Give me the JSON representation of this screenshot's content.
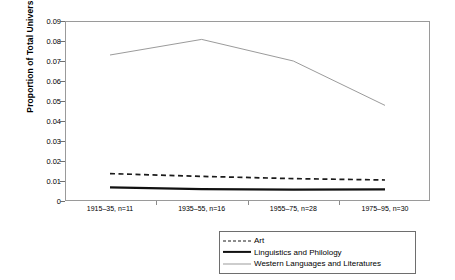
{
  "chart_data": {
    "type": "line",
    "title": "",
    "xlabel": "",
    "ylabel": "Proportion of Total University Faculty",
    "categories": [
      "1915–35, n=11",
      "1935–55, n=16",
      "1955–75, n=28",
      "1975–95, n=30"
    ],
    "x": [
      0,
      1,
      2,
      3
    ],
    "ylim": [
      0,
      0.09
    ],
    "yticks": [
      "0",
      "0.01",
      "0.02",
      "0.03",
      "0.04",
      "0.05",
      "0.06",
      "0.07",
      "0.08",
      "0.09"
    ],
    "ytick_values": [
      0,
      0.01,
      0.02,
      0.03,
      0.04,
      0.05,
      0.06,
      0.07,
      0.08,
      0.09
    ],
    "grid": false,
    "legend_position": "bottom-right",
    "series": [
      {
        "name": "Art",
        "style": "dashed",
        "color": "#1b1b1b",
        "values": [
          0.0137,
          0.0123,
          0.0112,
          0.0105
        ]
      },
      {
        "name": "Linguistics and Philology",
        "style": "solid-thick",
        "color": "#111111",
        "values": [
          0.0068,
          0.0059,
          0.0057,
          0.0058
        ]
      },
      {
        "name": "Western Languages and Literatures",
        "style": "solid-thin",
        "color": "#9b9b9b",
        "values": [
          0.073,
          0.0808,
          0.07,
          0.0478
        ]
      }
    ]
  },
  "axes": {
    "ylabel": "Proportion of Total University Faculty"
  },
  "legend": {
    "items": [
      {
        "label": "Art",
        "key": "dashed-line-key"
      },
      {
        "label": "Linguistics and Philology",
        "key": "thick-line-key"
      },
      {
        "label": "Western Languages and Literatures",
        "key": "thin-line-key"
      }
    ]
  }
}
